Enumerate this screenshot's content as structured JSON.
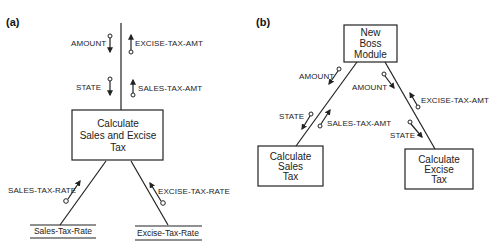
{
  "panel_a": {
    "label": "(a)",
    "module": {
      "lines": [
        "Calculate",
        "Sales and Excise",
        "Tax"
      ]
    },
    "couples_in": [
      {
        "name": "AMOUNT",
        "direction": "down"
      },
      {
        "name": "STATE",
        "direction": "down"
      }
    ],
    "couples_out": [
      {
        "name": "EXCISE-TAX-AMT",
        "direction": "up"
      },
      {
        "name": "SALES-TAX-AMT",
        "direction": "up"
      }
    ],
    "store_flows": [
      {
        "name": "SALES-TAX-RATE"
      },
      {
        "name": "EXCISE-TAX-RATE"
      }
    ],
    "data_stores": [
      {
        "name": "Sales-Tax-Rate"
      },
      {
        "name": "Excise-Tax-Rate"
      }
    ]
  },
  "panel_b": {
    "label": "(b)",
    "boss": {
      "lines": [
        "New",
        "Boss",
        "Module"
      ]
    },
    "sales_module": {
      "lines": [
        "Calculate",
        "Sales",
        "Tax"
      ]
    },
    "excise_module": {
      "lines": [
        "Calculate",
        "Excise",
        "Tax"
      ]
    },
    "sales_couples": [
      {
        "name": "AMOUNT",
        "direction": "down"
      },
      {
        "name": "STATE",
        "direction": "down"
      },
      {
        "name": "SALES-TAX-AMT",
        "direction": "up"
      }
    ],
    "excise_couples": [
      {
        "name": "AMOUNT",
        "direction": "down"
      },
      {
        "name": "EXCISE-TAX-AMT",
        "direction": "up"
      },
      {
        "name": "STATE",
        "direction": "down"
      }
    ]
  }
}
